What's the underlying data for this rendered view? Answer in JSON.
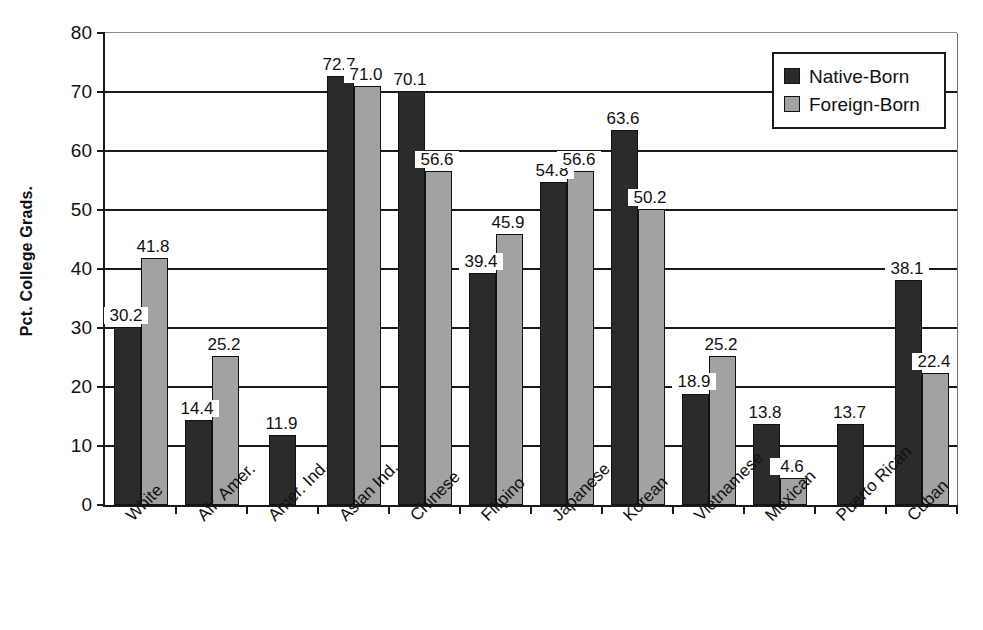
{
  "chart_data": {
    "type": "bar",
    "title": "",
    "subtitle": "",
    "xlabel": "",
    "ylabel": "Pct. College Grads.",
    "ylim": [
      0,
      80
    ],
    "ytick_step": 10,
    "yticks": [
      80,
      70,
      60,
      50,
      40,
      30,
      20,
      10,
      0
    ],
    "grid": "horizontal",
    "legend_position": "top-right",
    "categories": [
      "White",
      "Afr. Amer.",
      "Amer. Ind.",
      "Asian Ind.",
      "Chinese",
      "Filipino",
      "Japanese",
      "Korean",
      "Vietnamese",
      "Mexican",
      "Puerto Rican",
      "Cuban"
    ],
    "series": [
      {
        "name": "Native-Born",
        "color": "#2b2b2b",
        "values": [
          30.2,
          14.4,
          11.9,
          72.7,
          70.1,
          39.4,
          54.8,
          63.6,
          18.9,
          13.8,
          13.7,
          38.1
        ],
        "labels": [
          "30.2",
          "14.4",
          "11.9",
          "72.7",
          "70.1",
          "39.4",
          "54.8",
          "63.6",
          "18.9",
          "13.8",
          "13.7",
          "38.1"
        ]
      },
      {
        "name": "Foreign-Born",
        "color": "#a2a2a2",
        "values": [
          41.8,
          25.2,
          null,
          71.0,
          56.6,
          45.9,
          56.6,
          50.2,
          25.2,
          4.6,
          null,
          22.4
        ],
        "labels": [
          "41.8",
          "25.2",
          "",
          "71.0",
          "56.6",
          "45.9",
          "56.6",
          "50.2",
          "25.2",
          "4.6",
          "",
          "22.4"
        ]
      }
    ]
  },
  "legend": {
    "entries": [
      {
        "label": "Native-Born",
        "swatch": "native"
      },
      {
        "label": "Foreign-Born",
        "swatch": "foreign"
      }
    ]
  },
  "axis": {
    "y_title": "Pct. College Grads."
  }
}
